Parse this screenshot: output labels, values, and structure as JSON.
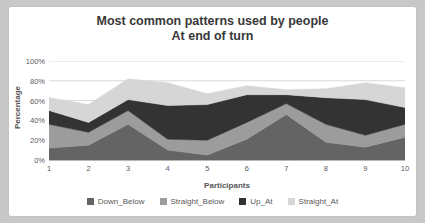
{
  "window": {
    "bg_color": "#c8c8c8"
  },
  "chart": {
    "title_line1": "Most common patterns used by people",
    "title_line2": "At end of turn",
    "y_axis_title": "Percentage",
    "x_axis_title": "Participants"
  },
  "chart_data": {
    "type": "area",
    "stacked": true,
    "title": "Most common patterns used by people At end of turn",
    "xlabel": "Participants",
    "ylabel": "Percentage",
    "x": [
      1,
      2,
      3,
      4,
      5,
      6,
      7,
      8,
      9,
      10
    ],
    "ylim": [
      0,
      100
    ],
    "y_ticks": [
      "0%",
      "20%",
      "40%",
      "60%",
      "80%",
      "100%"
    ],
    "y_tick_values": [
      0,
      20,
      40,
      60,
      80,
      100
    ],
    "grid": "horizontal",
    "legend_position": "bottom",
    "gridline_color": "#d9d9d9",
    "axis_line_color": "#a6a6a6",
    "series": [
      {
        "name": "Down_Below",
        "color": "#646464",
        "values": [
          12,
          15,
          36,
          10,
          5,
          21,
          46,
          18,
          13,
          23
        ]
      },
      {
        "name": "Straight_Below",
        "color": "#9c9c9c",
        "values": [
          24,
          13,
          14,
          11,
          15,
          17,
          11,
          18,
          12,
          13
        ]
      },
      {
        "name": "Up_At",
        "color": "#333333",
        "values": [
          14,
          10,
          11,
          34,
          36,
          28,
          9,
          27,
          36,
          17
        ]
      },
      {
        "name": "Straight_At",
        "color": "#d6d6d6",
        "values": [
          13,
          18,
          21,
          23,
          11,
          9,
          5,
          9,
          17,
          20
        ]
      }
    ]
  }
}
